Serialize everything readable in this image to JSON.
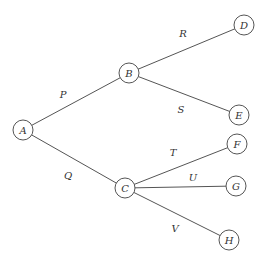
{
  "diagram": {
    "type": "tree",
    "nodes": [
      {
        "id": "A",
        "label": "A",
        "x": 23,
        "y": 130
      },
      {
        "id": "B",
        "label": "B",
        "x": 129,
        "y": 73
      },
      {
        "id": "C",
        "label": "C",
        "x": 125,
        "y": 188
      },
      {
        "id": "D",
        "label": "D",
        "x": 244,
        "y": 25
      },
      {
        "id": "E",
        "label": "E",
        "x": 239,
        "y": 115
      },
      {
        "id": "F",
        "label": "F",
        "x": 237,
        "y": 144
      },
      {
        "id": "G",
        "label": "G",
        "x": 236,
        "y": 186
      },
      {
        "id": "H",
        "label": "H",
        "x": 229,
        "y": 240
      }
    ],
    "edges": [
      {
        "from": "A",
        "to": "B",
        "label": "P",
        "lx": 63,
        "ly": 98
      },
      {
        "from": "A",
        "to": "C",
        "label": "Q",
        "lx": 68,
        "ly": 179
      },
      {
        "from": "B",
        "to": "D",
        "label": "R",
        "lx": 183,
        "ly": 37
      },
      {
        "from": "B",
        "to": "E",
        "label": "S",
        "lx": 181,
        "ly": 113
      },
      {
        "from": "C",
        "to": "F",
        "label": "T",
        "lx": 173,
        "ly": 156
      },
      {
        "from": "C",
        "to": "G",
        "label": "U",
        "lx": 193,
        "ly": 181
      },
      {
        "from": "C",
        "to": "H",
        "label": "V",
        "lx": 175,
        "ly": 232
      }
    ],
    "node_radius": 10,
    "colors": {
      "stroke": "#555555",
      "text": "#333333",
      "background": "#ffffff"
    }
  }
}
